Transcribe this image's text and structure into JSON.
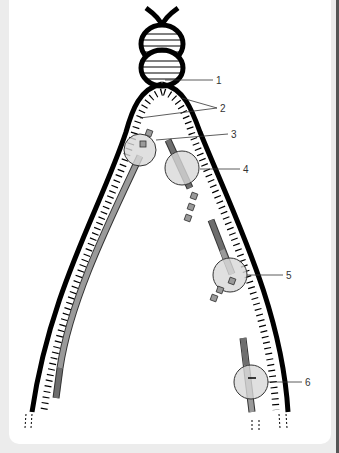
{
  "diagram": {
    "labels": [
      {
        "id": 1,
        "text": "1"
      },
      {
        "id": 2,
        "text": "2"
      },
      {
        "id": 3,
        "text": "3"
      },
      {
        "id": 4,
        "text": "4"
      },
      {
        "id": 5,
        "text": "5"
      },
      {
        "id": 6,
        "text": "6"
      }
    ],
    "colors": {
      "strand": "#000000",
      "new_strand_light": "#9a9a9a",
      "new_strand_dark": "#6e6e6e",
      "enzyme": "#d8d8d8",
      "background": "#ececec",
      "panel": "#ffffff"
    }
  }
}
